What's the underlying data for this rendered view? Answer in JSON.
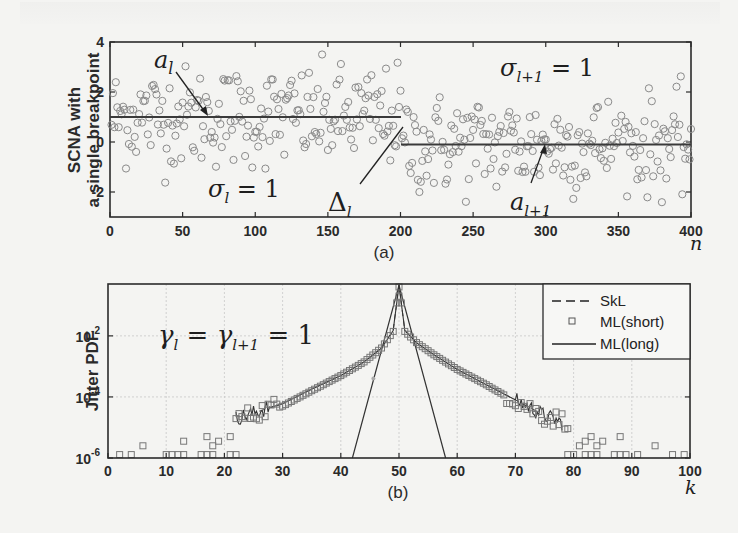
{
  "figure": {
    "panel_a_label": "(a)",
    "panel_b_label": "(b)"
  },
  "chart_data": [
    {
      "type": "scatter",
      "panel": "(a)",
      "title": "",
      "xlabel": "n",
      "ylabel": "SCNA with a single breakpoint",
      "ylabel_lines": [
        "SCNA with",
        "a single breakpoint"
      ],
      "xlim": [
        0,
        400
      ],
      "ylim": [
        -3,
        4
      ],
      "xticks": [
        0,
        50,
        100,
        150,
        200,
        250,
        300,
        350,
        400
      ],
      "yticks": [
        -2,
        0,
        2,
        4
      ],
      "grid": false,
      "marker": "open-circle",
      "segments": [
        {
          "name": "a_l",
          "x_start": 1,
          "x_end": 200,
          "mean": 1.0,
          "sigma": 1
        },
        {
          "name": "a_{l+1}",
          "x_start": 201,
          "x_end": 400,
          "mean": -0.1,
          "sigma": 1
        }
      ],
      "breakpoint_n": 200,
      "annotations": [
        {
          "text": "a_l",
          "x": 35,
          "y": 3.1,
          "arrow_to": [
            72,
            1.0
          ]
        },
        {
          "text": "σ_l = 1",
          "x": 70,
          "y": -2.0
        },
        {
          "text": "Δ_l",
          "x": 170,
          "y": -2.6,
          "line_to": [
            200,
            0.7
          ]
        },
        {
          "text": "σ_{l+1} = 1",
          "x": 280,
          "y": 2.8
        },
        {
          "text": "a_{l+1}",
          "x": 290,
          "y": -2.5,
          "arrow_to": [
            300,
            -0.05
          ]
        }
      ]
    },
    {
      "type": "line",
      "panel": "(b)",
      "title": "",
      "xlabel": "k",
      "ylabel": "Jitter PDF",
      "xlim": [
        0,
        100
      ],
      "ylim": [
        1e-06,
        0.5
      ],
      "yscale": "log",
      "xticks": [
        0,
        10,
        20,
        30,
        40,
        50,
        60,
        70,
        80,
        90,
        100
      ],
      "yticks": [
        "10^-6",
        "10^-4",
        "10^-2"
      ],
      "grid": true,
      "legend_position": "upper right",
      "annotation": "γ_l = γ_{l+1} = 1",
      "x": [
        22,
        25,
        30,
        35,
        40,
        44,
        47,
        49,
        50,
        51,
        53,
        56,
        60,
        65,
        70,
        75,
        78
      ],
      "series": [
        {
          "name": "SkL",
          "style": "dashed",
          "values": [
            2e-05,
            3e-05,
            6e-05,
            0.00018,
            0.0005,
            0.0014,
            0.004,
            0.015,
            0.45,
            0.015,
            0.006,
            0.0024,
            0.0008,
            0.00025,
            8e-05,
            2.5e-05,
            1.2e-05
          ]
        },
        {
          "name": "ML(short)",
          "style": "square-markers",
          "values": [
            1.5e-05,
            2.5e-05,
            5e-05,
            0.00016,
            0.0005,
            0.0014,
            0.004,
            0.014,
            0.4,
            0.014,
            0.006,
            0.0024,
            0.0008,
            0.00025,
            7e-05,
            2e-05,
            1.5e-05
          ],
          "floor_points_k": [
            2,
            4,
            10,
            11,
            12,
            13,
            16,
            17,
            18,
            21,
            22,
            79,
            80,
            82,
            83,
            84,
            87,
            88,
            89,
            91,
            97,
            99
          ],
          "floor_value": 1.2e-06
        },
        {
          "name": "ML(long)",
          "style": "solid",
          "values": [
            2e-05,
            3e-05,
            6e-05,
            0.00018,
            0.0005,
            0.0014,
            0.004,
            0.015,
            0.45,
            0.015,
            0.006,
            0.0024,
            0.0008,
            0.00025,
            8e-05,
            2.5e-05,
            1.4e-05
          ]
        },
        {
          "name": "narrow-triangle",
          "style": "solid",
          "x": [
            42,
            50,
            58
          ],
          "values": [
            1e-06,
            0.45,
            1e-06
          ]
        }
      ]
    }
  ],
  "labels": {
    "a_ylabel_1": "SCNA with",
    "a_ylabel_2": "a single breakpoint",
    "a_xvar": "n",
    "b_ylabel": "Jitter PDF",
    "b_xvar": "k",
    "sigma_l": "σ",
    "sigma_l_sub": "l",
    "sigma_l_rhs": " = 1",
    "sigma_l1_sub": "l+1",
    "delta": "Δ",
    "delta_sub": "l",
    "a": "a",
    "a_sub": "l",
    "a1_sub": "l+1",
    "gamma": "γ",
    "gamma_expr_mid": " = ",
    "gamma_expr_rhs": " = 1",
    "legend": [
      "SkL",
      "ML(short)",
      "ML(long)"
    ]
  }
}
